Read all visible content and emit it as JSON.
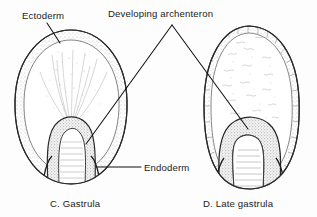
{
  "figure": {
    "title_alt": "Gastrulation stages diagram",
    "background_color": "#fdfdfd",
    "ink_color": "#1b1b1b",
    "labels": [
      {
        "id": "ectoderm",
        "text": "Ectoderm",
        "x": 22,
        "y": 19
      },
      {
        "id": "developing-archenteron",
        "text": "Developing archenteron",
        "x": 108,
        "y": 17
      },
      {
        "id": "endoderm",
        "text": "Endoderm",
        "x": 144,
        "y": 171
      }
    ],
    "captions": [
      {
        "id": "caption-c",
        "text": "C. Gastrula",
        "x": 50,
        "y": 207
      },
      {
        "id": "caption-d",
        "text": "D. Late gastrula",
        "x": 203,
        "y": 207
      }
    ],
    "leader_lines": [
      {
        "id": "ectoderm-leader",
        "points": "47,23 60,43"
      },
      {
        "id": "archenteron-leader-left",
        "points": "172,25 86,144"
      },
      {
        "id": "archenteron-leader-right",
        "points": "172,25 248,129"
      },
      {
        "id": "endoderm-leader",
        "points": "97,167 141,167"
      }
    ],
    "specimens": [
      {
        "id": "gastrula",
        "name": "C. Gastrula",
        "stage": "gastrula",
        "bounds": {
          "x": 14,
          "y": 30,
          "width": 114,
          "height": 155
        },
        "structures": [
          "ectoderm",
          "endoderm",
          "archenteron",
          "blastopore"
        ]
      },
      {
        "id": "late-gastrula",
        "name": "D. Late gastrula",
        "stage": "late gastrula",
        "bounds": {
          "x": 203,
          "y": 26,
          "width": 97,
          "height": 164
        },
        "structures": [
          "ectoderm",
          "endoderm",
          "archenteron",
          "blastopore"
        ]
      }
    ]
  }
}
